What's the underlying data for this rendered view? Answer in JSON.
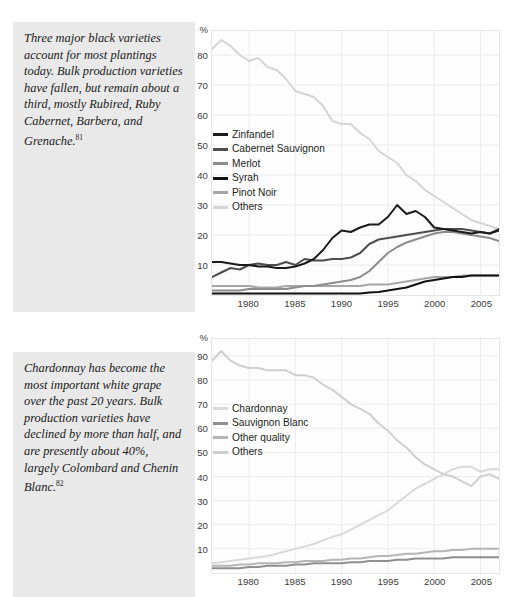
{
  "figures": [
    {
      "caption": "Three major black varieties account for most plantings today. Bulk production varieties have fallen, but remain about a third, mostly Rubired, Ruby Cabernet, Barbera, and Grenache.",
      "footnote": "81",
      "chart_data": {
        "type": "line",
        "title": "",
        "xlabel": "",
        "ylabel": "%",
        "ylim": [
          0,
          88
        ],
        "xlim": [
          1976,
          2007
        ],
        "grid": true,
        "legend_position": "inside-left",
        "yticks": [
          80,
          70,
          60,
          50,
          40,
          30,
          20,
          10
        ],
        "xticks": [
          1980,
          1985,
          1990,
          1995,
          2000,
          2005
        ],
        "x": [
          1976,
          1977,
          1978,
          1979,
          1980,
          1981,
          1982,
          1983,
          1984,
          1985,
          1986,
          1987,
          1988,
          1989,
          1990,
          1991,
          1992,
          1993,
          1994,
          1995,
          1996,
          1997,
          1998,
          1999,
          2000,
          2001,
          2002,
          2003,
          2004,
          2005,
          2006,
          2007
        ],
        "series": [
          {
            "name": "Zinfandel",
            "color": "#1a1a1a",
            "values": [
              11,
              11,
              10.5,
              10,
              10,
              9.5,
              9.5,
              9,
              9,
              9.5,
              10.5,
              12,
              15,
              19,
              21.5,
              21,
              22.5,
              23.5,
              23.5,
              26,
              30,
              27,
              28,
              26,
              22.5,
              22,
              21.5,
              21,
              20.5,
              21,
              20.5,
              21.5
            ]
          },
          {
            "name": "Cabernet Sauvignon",
            "color": "#4d4d4d",
            "values": [
              6,
              7.5,
              9,
              8.5,
              10,
              10.5,
              10,
              10,
              11,
              10,
              12,
              11.5,
              11.5,
              12,
              12,
              12.5,
              14,
              17,
              18.5,
              19,
              19.5,
              20,
              20.5,
              21,
              21.5,
              22,
              22,
              22,
              21.5,
              21,
              20.5,
              22
            ]
          },
          {
            "name": "Merlot",
            "color": "#8c8c8c",
            "values": [
              1.5,
              1.5,
              1.5,
              1.5,
              2,
              2,
              2,
              2,
              2,
              2.5,
              3,
              3,
              3.5,
              4,
              4.5,
              5,
              6,
              8,
              11,
              14,
              16,
              17.5,
              18.5,
              19.5,
              20.5,
              21,
              21,
              20.5,
              20,
              19.5,
              19,
              18
            ]
          },
          {
            "name": "Syrah",
            "color": "#111111",
            "values": [
              0.5,
              0.5,
              0.5,
              0.5,
              0.5,
              0.5,
              0.5,
              0.5,
              0.5,
              0.5,
              0.5,
              0.5,
              0.5,
              0.5,
              0.5,
              0.5,
              0.5,
              0.8,
              1,
              1.5,
              2,
              2.5,
              3.5,
              4.5,
              5,
              5.5,
              6,
              6,
              6.5,
              6.5,
              6.5,
              6.5
            ]
          },
          {
            "name": "Pinot Noir",
            "color": "#a6a6a6",
            "values": [
              3,
              3,
              3,
              3,
              3,
              2.5,
              2.5,
              2.5,
              3,
              3,
              3,
              3,
              3,
              3,
              3,
              3,
              3,
              3.5,
              3.5,
              3.5,
              4,
              4.5,
              5,
              5.5,
              6,
              6,
              6,
              6.5,
              6.5,
              6.5,
              6.5,
              6.5
            ]
          },
          {
            "name": "Others",
            "color": "#d4d4d4",
            "values": [
              82,
              85,
              83,
              80,
              78,
              79,
              76,
              75,
              72,
              68,
              67,
              66,
              63,
              58,
              57,
              57,
              54,
              52,
              48,
              46,
              44,
              40,
              38,
              35,
              33,
              31,
              29,
              27,
              25,
              24,
              23,
              22
            ]
          }
        ]
      }
    },
    {
      "caption": "Chardonnay has become the most important white grape over the past 20 years. Bulk production varieties have declined by more than half, and are presently about 40%, largely Colombard and Chenin Blanc.",
      "footnote": "82",
      "chart_data": {
        "type": "line",
        "title": "",
        "xlabel": "",
        "ylabel": "%",
        "ylim": [
          0,
          97
        ],
        "xlim": [
          1976,
          2007
        ],
        "grid": true,
        "legend_position": "inside-left",
        "yticks": [
          90,
          80,
          70,
          60,
          50,
          40,
          30,
          20,
          10
        ],
        "xticks": [
          1980,
          1985,
          1990,
          1995,
          2000,
          2005
        ],
        "x": [
          1976,
          1977,
          1978,
          1979,
          1980,
          1981,
          1982,
          1983,
          1984,
          1985,
          1986,
          1987,
          1988,
          1989,
          1990,
          1991,
          1992,
          1993,
          1994,
          1995,
          1996,
          1997,
          1998,
          1999,
          2000,
          2001,
          2002,
          2003,
          2004,
          2005,
          2006,
          2007
        ],
        "series": [
          {
            "name": "Chardonnay",
            "color": "#d9d9d9",
            "values": [
              4,
              4.5,
              5,
              5.5,
              6,
              6.5,
              7,
              8,
              9,
              10,
              11,
              12,
              13.5,
              15,
              16,
              18,
              20,
              22,
              24,
              26,
              29,
              32,
              35,
              37,
              39,
              41,
              43,
              44,
              44,
              42,
              43,
              43
            ]
          },
          {
            "name": "Sauvignon Blanc",
            "color": "#8f8f8f",
            "values": [
              2,
              2,
              2,
              2,
              2.5,
              2.5,
              3,
              3,
              3,
              3.5,
              3.5,
              4,
              4,
              4,
              4,
              4.5,
              4.5,
              5,
              5,
              5,
              5.5,
              5.5,
              6,
              6,
              6,
              6,
              6.5,
              6.5,
              6.5,
              6.5,
              6.5,
              6.5
            ]
          },
          {
            "name": "Other quality",
            "color": "#b5b5b5",
            "values": [
              3,
              3,
              3,
              3.5,
              3.5,
              4,
              4,
              4,
              4.5,
              4.5,
              5,
              5,
              5,
              5.5,
              5.5,
              6,
              6,
              6.5,
              7,
              7,
              7.5,
              8,
              8,
              8.5,
              9,
              9,
              9.5,
              9.5,
              10,
              10,
              10,
              10
            ]
          },
          {
            "name": "Others",
            "color": "#cfcfcf",
            "values": [
              88,
              92,
              88,
              86,
              85,
              85,
              84,
              84,
              84,
              82,
              82,
              81,
              78,
              76,
              73,
              70,
              68,
              66,
              62,
              59,
              55,
              52,
              48,
              45,
              43,
              41,
              40,
              38,
              36,
              40,
              41,
              39
            ]
          }
        ]
      }
    }
  ]
}
